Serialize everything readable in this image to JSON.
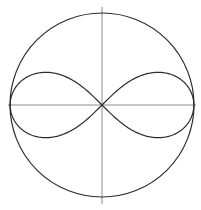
{
  "figure": {
    "background_color": "#ffffff",
    "width": 201,
    "height": 210
  },
  "geometry": {
    "center_x": 102,
    "center_y": 105
  },
  "axes": {
    "color": "#8c8c8c",
    "stroke_width": 1,
    "horizontal": {
      "name": "horizontal-axis",
      "x1": 8,
      "y1": 105,
      "x2": 196,
      "y2": 105
    },
    "vertical": {
      "name": "vertical-axis",
      "x1": 102,
      "y1": 7,
      "x2": 102,
      "y2": 204
    }
  },
  "circle": {
    "name": "bounding-circle",
    "cx": 102,
    "cy": 105,
    "r": 92,
    "stroke_color": "#2b2b2b",
    "stroke_width": 1.2,
    "fill": "none"
  },
  "lemniscate": {
    "name": "lemniscate-curve",
    "stroke_color": "#2b2b2b",
    "stroke_width": 1.2,
    "fill": "none",
    "half_width": 90,
    "half_height": 25,
    "crossing_angle_deg": 30,
    "left_lobe_tip_x": 12,
    "right_lobe_tip_x": 192,
    "upper_peak_y": 80,
    "lower_peak_y": 130,
    "path": "M 102 105 C 118 111 138 128 158 129 C 176 130 190 120 190 105 C 190 90 176 80 158 81 C 138 82 118 99 102 105 C 86 111 66 128 46 129 C 28 130 14 120 14 105 C 14 90 28 80 46 81 C 66 82 86 99 102 105 Z"
  },
  "chart_data": {
    "type": "line",
    "subtitle": "",
    "xlabel": "",
    "ylabel": "",
    "grid": false,
    "legend": "none",
    "xlim": [
      -1.05,
      1.05
    ],
    "ylim": [
      -1.05,
      1.05
    ],
    "xticks": [],
    "yticks": [],
    "annotations": [],
    "series": [
      {
        "name": "circle",
        "kind": "circle",
        "center": [
          0,
          0
        ],
        "radius": 1.0,
        "equation": "x^2 + y^2 = 1"
      },
      {
        "name": "lemniscate",
        "kind": "lemniscate",
        "equation": "r^2 = a^2 * cos(2*theta),  a = 0.98",
        "a": 0.98,
        "x": [
          0.0,
          0.19,
          0.39,
          0.57,
          0.72,
          0.84,
          0.92,
          0.97,
          0.98,
          0.97,
          0.92,
          0.84,
          0.72,
          0.57,
          0.39,
          0.19,
          0.0,
          -0.19,
          -0.39,
          -0.57,
          -0.72,
          -0.84,
          -0.92,
          -0.97,
          -0.98,
          -0.97,
          -0.92,
          -0.84,
          -0.72,
          -0.57,
          -0.39,
          -0.19,
          0.0
        ],
        "y": [
          0.0,
          0.11,
          0.2,
          0.26,
          0.27,
          0.25,
          0.2,
          0.12,
          0.0,
          -0.12,
          -0.2,
          -0.25,
          -0.27,
          -0.26,
          -0.2,
          -0.11,
          0.0,
          0.11,
          0.2,
          0.26,
          0.27,
          0.25,
          0.2,
          0.12,
          0.0,
          -0.12,
          -0.2,
          -0.25,
          -0.27,
          -0.26,
          -0.2,
          -0.11,
          0.0
        ]
      },
      {
        "name": "horizontal-axis",
        "kind": "axis-line",
        "x": [
          -1.02,
          1.02
        ],
        "y": [
          0,
          0
        ]
      },
      {
        "name": "vertical-axis",
        "kind": "axis-line",
        "x": [
          0,
          0
        ],
        "y": [
          1.07,
          -1.08
        ]
      }
    ]
  }
}
